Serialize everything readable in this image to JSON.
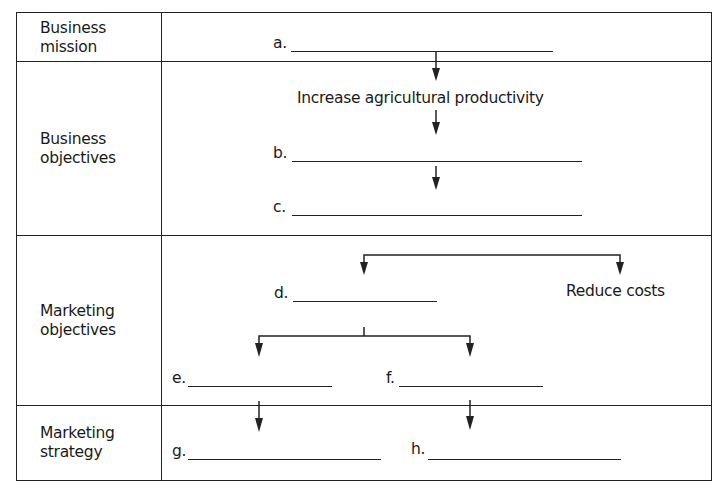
{
  "diagram": {
    "rows": [
      {
        "label_line1": "Business",
        "label_line2": "mission"
      },
      {
        "label_line1": "Business",
        "label_line2": "objectives"
      },
      {
        "label_line1": "Marketing",
        "label_line2": "objectives"
      },
      {
        "label_line1": "Marketing",
        "label_line2": "strategy"
      }
    ],
    "blanks": {
      "a": "a.",
      "b": "b.",
      "c": "c.",
      "d": "d.",
      "e": "e.",
      "f": "f.",
      "g": "g.",
      "h": "h."
    },
    "given_text": {
      "business_objective_1": "Increase agricultural productivity",
      "marketing_objective_2": "Reduce costs"
    },
    "line_color": "#222222"
  }
}
